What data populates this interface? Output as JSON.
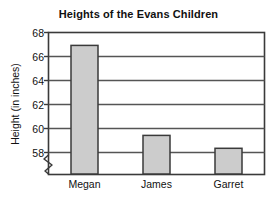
{
  "chart_data": {
    "type": "bar",
    "title": "Heights of the Evans Children",
    "xlabel": "",
    "ylabel": "Height (in inches)",
    "categories": [
      "Megan",
      "James",
      "Garret"
    ],
    "values": [
      67,
      60,
      59
    ],
    "ylim": [
      57,
      68
    ],
    "y_ticks": [
      58,
      60,
      62,
      64,
      66,
      68
    ],
    "y_tick_labels": [
      "58",
      "60",
      "62",
      "64",
      "66",
      "68"
    ],
    "axis_break": true,
    "grid": true,
    "grid_axis": "y",
    "legend": null,
    "bar_fill": "#cccccc",
    "bar_stroke": "#3a3a3a",
    "axis_color": "#3a3a3a",
    "grid_color": "#555555",
    "background": "#ffffff"
  }
}
